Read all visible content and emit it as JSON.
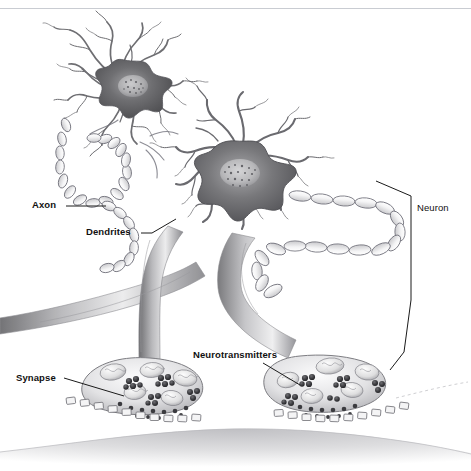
{
  "figure": {
    "style": "grayscale pencil/airbrush scientific illustration",
    "background_color": "#ffffff",
    "top_rule_color": "#c9ccd2"
  },
  "labels": [
    {
      "key": "axon",
      "text": "Axon",
      "x": 32,
      "y": 200,
      "leader": "horizontal line to the right toward myelinated axon chain"
    },
    {
      "key": "dendrites",
      "text": "Dendrites",
      "x": 86,
      "y": 227,
      "leader": "angled line up-right toward branching dendrites"
    },
    {
      "key": "neurotransmitters",
      "text": "Neurotransmitters",
      "x": 193,
      "y": 350,
      "leader": "angled line down-right into synaptic vesicles"
    },
    {
      "key": "synapse",
      "text": "Synapse",
      "x": 16,
      "y": 373,
      "leader": "angled line down-right to synaptic cleft"
    },
    {
      "key": "neuron",
      "text": "Neuron",
      "x": 417,
      "y": 208,
      "leader": "tall bracket spanning the whole neuron"
    }
  ],
  "structures": [
    {
      "name": "upper-neuron-soma",
      "description": "star shaped cell body with radiating dendrites, upper left"
    },
    {
      "name": "main-neuron-soma",
      "description": "large star shaped cell body with speckled nucleus, center"
    },
    {
      "name": "myelinated-axon-left",
      "description": "chain of myelin sheath segments looping at left"
    },
    {
      "name": "myelinated-axon-right",
      "description": "serpentine chain of myelin sheath segments at right"
    },
    {
      "name": "axon-trunk-left",
      "description": "thick gray axon descending to left terminal"
    },
    {
      "name": "axon-trunk-right",
      "description": "thick gray axon descending to right terminal"
    },
    {
      "name": "terminal-bulb-left",
      "description": "synaptic terminal with vesicle clusters and mitochondria"
    },
    {
      "name": "terminal-bulb-right",
      "description": "synaptic terminal with vesicle clusters and mitochondria"
    },
    {
      "name": "postsynaptic-cell",
      "description": "gray postsynaptic membrane across the bottom with receptors"
    }
  ],
  "palette": {
    "soma_dark": "#5f5f61",
    "soma_mid": "#8d8d90",
    "membrane_gray": "#d8d8da",
    "outline": "#4a4a4c",
    "vesicle_dark": "#3a3a3d",
    "ink": "#111111"
  }
}
